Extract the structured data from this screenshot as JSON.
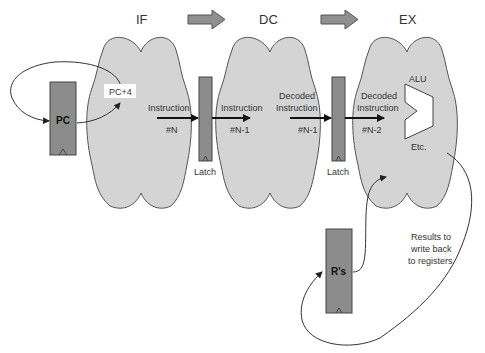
{
  "stages": [
    {
      "id": "IF",
      "label": "IF"
    },
    {
      "id": "DC",
      "label": "DC"
    },
    {
      "id": "EX",
      "label": "EX"
    }
  ],
  "registers": {
    "pc": "PC",
    "rs": "R's"
  },
  "latches": [
    "Latch",
    "Latch"
  ],
  "labels": {
    "pc_plus_4": "PC+4",
    "if_instruction": "Instruction",
    "if_num": "#N",
    "dc_instruction": "Instruction",
    "dc_num": "#N-1",
    "dc_decoded_1": "Decoded",
    "dc_decoded_2": "Instruction",
    "dc_decoded_num": "#N-1",
    "ex_decoded_1": "Decoded",
    "ex_decoded_2": "Instruction",
    "ex_num": "#N-2",
    "alu": "ALU",
    "etc": "Etc.",
    "results_1": "Results to",
    "results_2": "write back",
    "results_3": "to registers"
  },
  "colors": {
    "cloud_fill": "#d4d4d4",
    "register_fill": "#8c8c8c",
    "block_arrow_fill": "#8f8f8f",
    "background": "#ffffff"
  }
}
